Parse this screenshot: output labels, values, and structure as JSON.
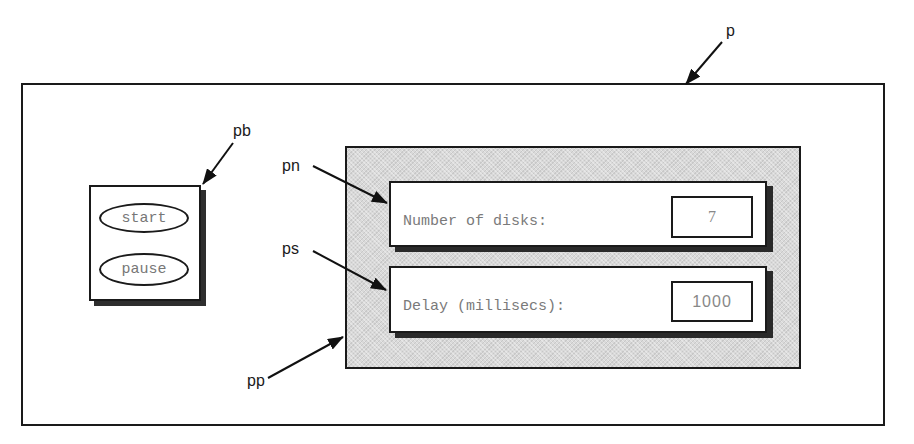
{
  "diagram": {
    "frames": {
      "p": {
        "id": "p"
      },
      "pb": {
        "id": "pb",
        "buttons": [
          {
            "label": "start"
          },
          {
            "label": "pause"
          }
        ]
      },
      "pp": {
        "id": "pp",
        "rows": [
          {
            "id": "pn",
            "label": "Number of disks:",
            "value": "7"
          },
          {
            "id": "ps",
            "label": "Delay (millisecs):",
            "value": "1000"
          }
        ]
      }
    },
    "callouts": [
      {
        "label": "p",
        "target": "outer-frame"
      },
      {
        "label": "pb",
        "target": "button-panel"
      },
      {
        "label": "pn",
        "target": "number-of-disks-panel"
      },
      {
        "label": "ps",
        "target": "delay-panel"
      },
      {
        "label": "pp",
        "target": "parameter-panel"
      }
    ],
    "colors": {
      "border": "#1a1a1a",
      "panel_fill": "#d9d9d9",
      "text_gray": "#7a7a7a",
      "shadow": "#2a2a2a"
    }
  }
}
